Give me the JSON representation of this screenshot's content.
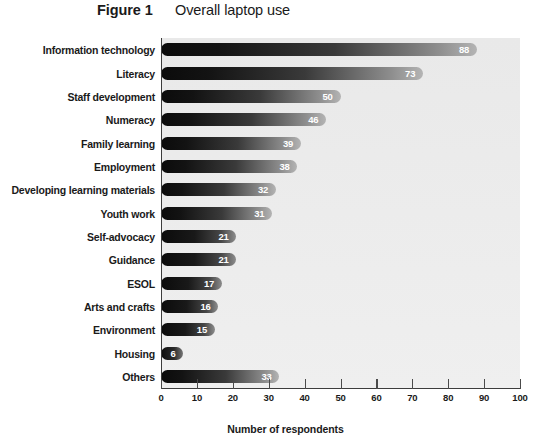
{
  "figure": {
    "number_label": "Figure 1",
    "title": "Overall laptop use"
  },
  "colors": {
    "bar_dark": "#0b0b0b",
    "bar_light": "#b4b4b4",
    "plot_background": "#ebebeb",
    "axis": "#3c3c3c",
    "value_label": "#ffffff",
    "text": "#1a1a1a"
  },
  "chart_data": {
    "type": "bar",
    "orientation": "horizontal",
    "title": "Overall laptop use",
    "xlabel": "Number of respondents",
    "ylabel": "",
    "xlim": [
      0,
      100
    ],
    "xticks": [
      0,
      10,
      20,
      30,
      40,
      50,
      60,
      70,
      80,
      90,
      100
    ],
    "xtick_labels": [
      "0",
      "10",
      "20",
      "30",
      "40",
      "50",
      "60",
      "70",
      "80",
      "90",
      "100"
    ],
    "grid": false,
    "legend": false,
    "data_labels": true,
    "categories": [
      "Information technology",
      "Literacy",
      "Staff development",
      "Numeracy",
      "Family learning",
      "Employment",
      "Developing learning materials",
      "Youth work",
      "Self-advocacy",
      "Guidance",
      "ESOL",
      "Arts and crafts",
      "Environment",
      "Housing",
      "Others"
    ],
    "values": [
      88,
      73,
      50,
      46,
      39,
      38,
      32,
      31,
      21,
      21,
      17,
      16,
      15,
      6,
      33
    ]
  }
}
